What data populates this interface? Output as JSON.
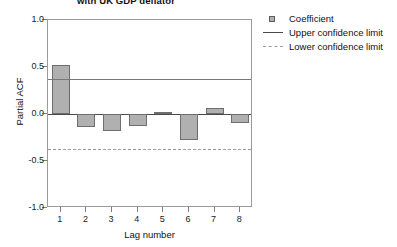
{
  "chart_data": {
    "type": "bar",
    "title": "with UK GDP deflator",
    "xlabel": "Lag number",
    "ylabel": "Partial ACF",
    "categories": [
      "1",
      "2",
      "3",
      "4",
      "5",
      "6",
      "7",
      "8"
    ],
    "values": [
      0.52,
      -0.14,
      -0.18,
      -0.13,
      0.02,
      -0.28,
      0.06,
      -0.1
    ],
    "series": [
      {
        "name": "Coefficient",
        "values": [
          0.52,
          -0.14,
          -0.18,
          -0.13,
          0.02,
          -0.28,
          0.06,
          -0.1
        ]
      }
    ],
    "ylim": [
      -1.0,
      1.0
    ],
    "yticks": [
      "1.0",
      "0.5",
      "0.0",
      "-0.5",
      "-1.0"
    ],
    "ytick_values": [
      1.0,
      0.5,
      0.0,
      -0.5,
      -1.0
    ],
    "grid": false,
    "legend_position": "top-right",
    "reference_lines": [
      {
        "name": "Upper confidence limit",
        "value": 0.37,
        "style": "solid"
      },
      {
        "name": "Lower confidence limit",
        "value": -0.37,
        "style": "dashed"
      }
    ],
    "bar_color": "#b0b0b0",
    "bar_edge_color": "#6e6e6e"
  },
  "legend": {
    "items": [
      {
        "label": "Coefficient",
        "key": "square-marker"
      },
      {
        "label": "Upper confidence limit",
        "key": "solid-line"
      },
      {
        "label": "Lower confidence limit",
        "key": "dashed-line"
      }
    ]
  }
}
